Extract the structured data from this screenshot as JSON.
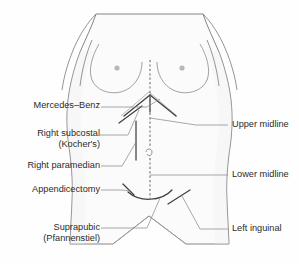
{
  "figure": {
    "background_color": "#fefefe",
    "outline_color": "#6b6b6b",
    "incision_color": "#4a4a4a",
    "leader_color": "#7a7a7a",
    "text_color": "#2b2b2b",
    "skin_fill": "#fbfbfb"
  },
  "labels": {
    "left": [
      {
        "id": "mercedes-benz",
        "lines": [
          "Mercedes–Benz"
        ],
        "x": 16,
        "y": 103
      },
      {
        "id": "right-subcostal",
        "lines": [
          "Right subcostal",
          "(Kocher's)"
        ],
        "x": 16,
        "y": 131
      },
      {
        "id": "right-paramedian",
        "lines": [
          "Right paramedian"
        ],
        "x": 10,
        "y": 162
      },
      {
        "id": "appendicectomy",
        "lines": [
          "Appendicectomy"
        ],
        "x": 13,
        "y": 186
      },
      {
        "id": "suprapubic",
        "lines": [
          "Suprapubic",
          "(Pfannenstiel)"
        ],
        "x": 14,
        "y": 224
      }
    ],
    "right": [
      {
        "id": "upper-midline",
        "lines": [
          "Upper midline"
        ],
        "x": 233,
        "y": 121
      },
      {
        "id": "lower-midline",
        "lines": [
          "Lower midline"
        ],
        "x": 233,
        "y": 171
      },
      {
        "id": "left-inguinal",
        "lines": [
          "Left inguinal"
        ],
        "x": 233,
        "y": 225
      }
    ]
  },
  "incisions": [
    {
      "id": "mercedes-benz",
      "type": "chevron-with-vertical"
    },
    {
      "id": "right-subcostal",
      "type": "oblique-short"
    },
    {
      "id": "right-paramedian",
      "type": "vertical-paramedian"
    },
    {
      "id": "upper-midline",
      "type": "vertical-dashed-upper"
    },
    {
      "id": "lower-midline",
      "type": "vertical-dashed-lower"
    },
    {
      "id": "appendicectomy",
      "type": "grid-iron-oblique"
    },
    {
      "id": "suprapubic",
      "type": "transverse-curved"
    },
    {
      "id": "left-inguinal",
      "type": "oblique-inguinal"
    }
  ]
}
